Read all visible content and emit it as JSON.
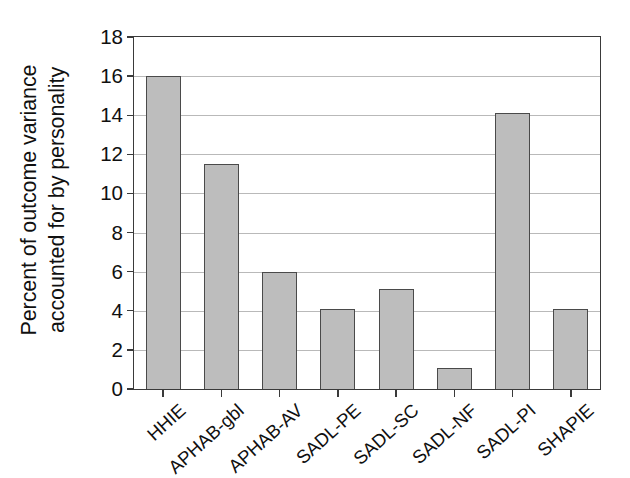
{
  "chart_data": {
    "type": "bar",
    "title": "",
    "subtitle": "",
    "xlabel": "",
    "ylabel": "Percent of outcome variance accounted for by personality",
    "ylabel_lines": [
      "Percent of outcome variance",
      "accounted for by personality"
    ],
    "categories": [
      "HHIE",
      "APHAB-gbl",
      "APHAB-AV",
      "SADL-PE",
      "SADL-SC",
      "SADL-NF",
      "SADL-PI",
      "SHAPIE"
    ],
    "values": [
      16.0,
      11.5,
      6.0,
      4.1,
      5.1,
      1.1,
      14.1,
      4.1
    ],
    "ylim": [
      0,
      18
    ],
    "ytick_values": [
      0,
      2,
      4,
      6,
      8,
      10,
      12,
      14,
      16,
      18
    ],
    "ytick_labels": [
      "0",
      "2",
      "4",
      "6",
      "8",
      "10",
      "12",
      "14",
      "16",
      "18"
    ],
    "grid": true,
    "grid_axis": "y",
    "legend": false,
    "legend_position": "none",
    "bar_fill_color": "#bdbdbd",
    "bar_edge_color": "#4a4a4a",
    "axis_color": "#3a3a3a",
    "grid_color": "#b9b9b9",
    "background_color": "#ffffff",
    "xtick_label_rotation": -42
  }
}
